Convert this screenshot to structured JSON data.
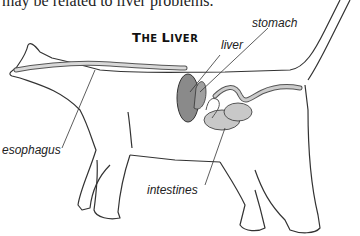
{
  "body_text": "may be related to liver problems.",
  "diagram": {
    "title": "The Liver",
    "title_first_letter": "T",
    "title_rest_1": "HE ",
    "title_letter_2": "L",
    "title_rest_2": "IVER",
    "labels": {
      "stomach": "stomach",
      "liver": "liver",
      "esophagus": "esophagus",
      "intestines": "intestines"
    },
    "colors": {
      "organ_fill": "#8a8a8a",
      "outline": "#333333",
      "tube_fill": "#c8c8c8"
    }
  }
}
